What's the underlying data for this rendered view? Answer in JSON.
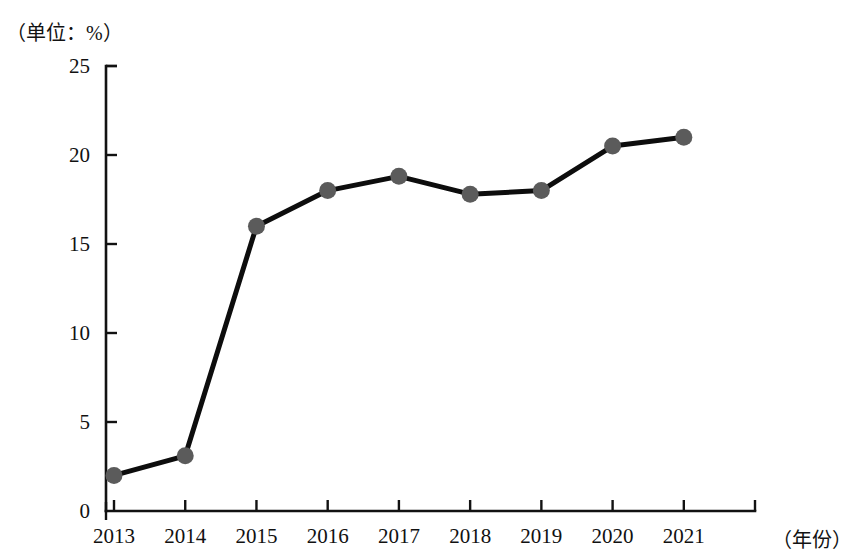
{
  "chart_data": {
    "type": "line",
    "title": "",
    "subtitle": "",
    "unit_note": "（单位：%）",
    "xlabel": "（年份）",
    "ylabel": "",
    "categories": [
      "2013",
      "2014",
      "2015",
      "2016",
      "2017",
      "2018",
      "2019",
      "2020",
      "2021"
    ],
    "values": [
      2.0,
      3.1,
      16.0,
      18.0,
      18.8,
      17.8,
      18.0,
      20.5,
      21.0
    ],
    "series": [
      {
        "name": "占比",
        "values": [
          2.0,
          3.1,
          16.0,
          18.0,
          18.8,
          17.8,
          18.0,
          20.5,
          21.0
        ]
      }
    ],
    "ylim": [
      0,
      25
    ],
    "yticks": [
      "0",
      "5",
      "10",
      "15",
      "20",
      "25"
    ],
    "ytick_values": [
      0,
      5,
      10,
      15,
      20,
      25
    ],
    "xticks": [
      "2013",
      "2014",
      "2015",
      "2016",
      "2017",
      "2018",
      "2019",
      "2020",
      "2021"
    ],
    "grid": false,
    "legend": "none",
    "legend_position": "none",
    "line_color": "#0d0d0d",
    "marker_color": "#5b5b5b",
    "axis_color": "#121212",
    "background_color": "#ffffff",
    "marker_shape": "circle",
    "marker_size": 17
  },
  "axis": {
    "y_unit_caption": "（单位：%）",
    "x_unit_caption": "（年份）"
  }
}
